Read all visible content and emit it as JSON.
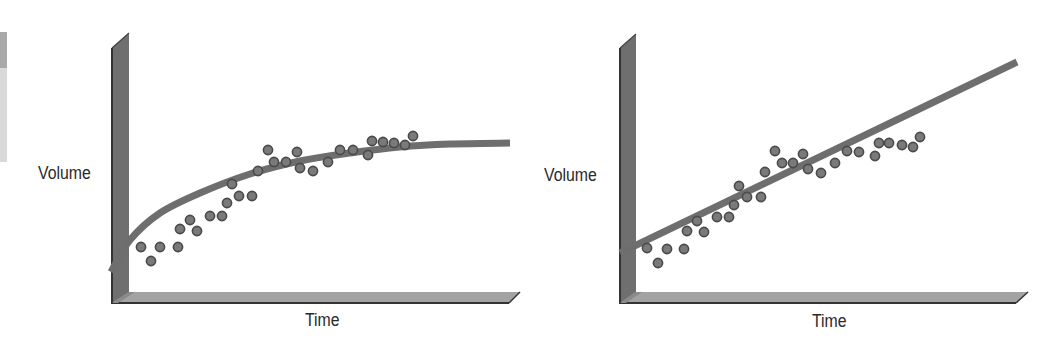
{
  "chart_data": [
    {
      "type": "scatter",
      "panel": "left",
      "title": "",
      "xlabel": "Time",
      "ylabel": "Volume",
      "fit": "logarithmic-saturating curve",
      "grid": false,
      "legend": null,
      "points_px": [
        [
          141,
          247
        ],
        [
          151,
          261
        ],
        [
          160,
          247
        ],
        [
          178,
          247
        ],
        [
          180,
          229
        ],
        [
          190,
          220
        ],
        [
          197,
          231
        ],
        [
          210,
          216
        ],
        [
          222,
          216
        ],
        [
          227,
          203
        ],
        [
          239,
          196
        ],
        [
          252,
          196
        ],
        [
          232,
          184
        ],
        [
          258,
          171
        ],
        [
          268,
          150
        ],
        [
          274,
          162
        ],
        [
          286,
          162
        ],
        [
          297,
          152
        ],
        [
          300,
          168
        ],
        [
          313,
          171
        ],
        [
          328,
          162
        ],
        [
          340,
          150
        ],
        [
          353,
          150
        ],
        [
          368,
          155
        ],
        [
          372,
          141
        ],
        [
          383,
          142
        ],
        [
          394,
          143
        ],
        [
          405,
          145
        ],
        [
          413,
          136
        ]
      ],
      "fit_curve_px": [
        [
          111,
          272
        ],
        [
          130,
          240
        ],
        [
          160,
          213
        ],
        [
          200,
          193
        ],
        [
          250,
          174
        ],
        [
          300,
          161
        ],
        [
          350,
          153
        ],
        [
          400,
          147
        ],
        [
          450,
          144
        ],
        [
          510,
          143
        ]
      ]
    },
    {
      "type": "scatter",
      "panel": "right",
      "title": "",
      "xlabel": "Time",
      "ylabel": "Volume",
      "fit": "linear",
      "grid": false,
      "legend": null,
      "points_px": [
        [
          647,
          248
        ],
        [
          658,
          263
        ],
        [
          667,
          249
        ],
        [
          684,
          249
        ],
        [
          687,
          231
        ],
        [
          697,
          221
        ],
        [
          704,
          232
        ],
        [
          717,
          217
        ],
        [
          729,
          217
        ],
        [
          734,
          205
        ],
        [
          747,
          197
        ],
        [
          761,
          197
        ],
        [
          739,
          186
        ],
        [
          765,
          172
        ],
        [
          775,
          151
        ],
        [
          782,
          163
        ],
        [
          793,
          163
        ],
        [
          803,
          154
        ],
        [
          808,
          169
        ],
        [
          821,
          173
        ],
        [
          835,
          163
        ],
        [
          847,
          151
        ],
        [
          859,
          152
        ],
        [
          875,
          156
        ],
        [
          879,
          143
        ],
        [
          889,
          143
        ],
        [
          902,
          145
        ],
        [
          913,
          147
        ],
        [
          920,
          137
        ]
      ],
      "fit_line_px": [
        [
          620,
          253
        ],
        [
          1017,
          62
        ]
      ]
    }
  ],
  "panels": {
    "left": {
      "ylabel": "Volume",
      "xlabel": "Time"
    },
    "right": {
      "ylabel": "Volume",
      "xlabel": "Time"
    }
  },
  "colors": {
    "wall": "#6f6f6f",
    "wall_edge": "#333333",
    "floor": "#a3a3a3",
    "floor_edge": "#333333",
    "fit": "#6e6e6e",
    "dot_fill": "#7a7a7a",
    "dot_stroke": "#4a4a4a"
  }
}
